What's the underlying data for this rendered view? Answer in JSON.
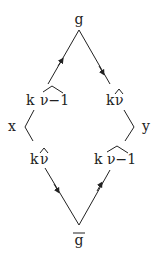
{
  "diagram": {
    "nodes": {
      "top": {
        "label": "g"
      },
      "bottom": {
        "label": "g",
        "overline": true
      },
      "left_upper": {
        "prefix": "k",
        "hat": "ν−1"
      },
      "right_upper": {
        "prefix": "k",
        "hat": "ν"
      },
      "left_lower": {
        "prefix": "k",
        "hat": "ν"
      },
      "right_lower": {
        "prefix": "k",
        "hat": "ν−1"
      },
      "left_side": {
        "label": "x"
      },
      "right_side": {
        "label": "y"
      }
    },
    "colors": {
      "stroke": "#222222",
      "background": "#ffffff"
    }
  }
}
